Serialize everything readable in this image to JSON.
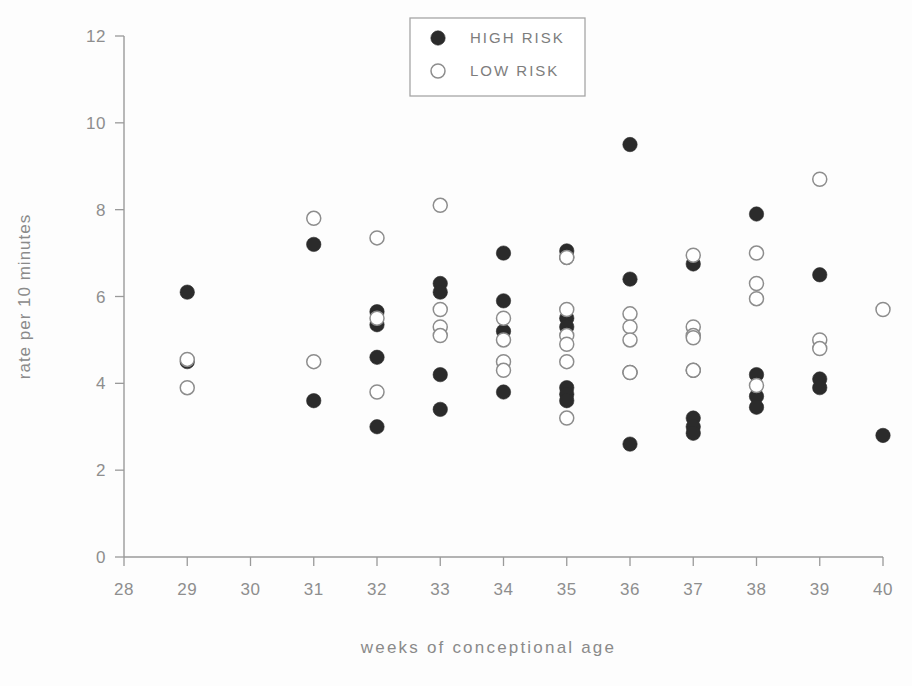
{
  "chart_data": {
    "type": "scatter",
    "title": "",
    "xlabel": "weeks of conceptional age",
    "ylabel": "rate per 10 minutes",
    "xlim": [
      28,
      40
    ],
    "ylim": [
      0,
      12
    ],
    "grid": false,
    "x_ticks": [
      28,
      29,
      30,
      31,
      32,
      33,
      34,
      35,
      36,
      37,
      38,
      39,
      40
    ],
    "x_tick_labels": [
      "28",
      "29",
      "30",
      "31",
      "32",
      "33",
      "34",
      "35",
      "36",
      "37",
      "38",
      "39",
      "40"
    ],
    "y_ticks": [
      0,
      2,
      4,
      6,
      8,
      10,
      12
    ],
    "y_tick_labels": [
      "0",
      "2",
      "4",
      "6",
      "8",
      "10",
      "12"
    ],
    "legend_position": "top-center",
    "series": [
      {
        "name": "HIGH RISK",
        "marker": "filled-circle",
        "color": "#2b2b2b",
        "points": [
          [
            29,
            6.1
          ],
          [
            29,
            4.5
          ],
          [
            31,
            7.2
          ],
          [
            31,
            3.6
          ],
          [
            32,
            5.65
          ],
          [
            32,
            5.35
          ],
          [
            32,
            4.6
          ],
          [
            32,
            3.0
          ],
          [
            33,
            6.3
          ],
          [
            33,
            6.1
          ],
          [
            33,
            4.2
          ],
          [
            33,
            3.4
          ],
          [
            34,
            7.0
          ],
          [
            34,
            5.9
          ],
          [
            34,
            5.2
          ],
          [
            34,
            3.8
          ],
          [
            35,
            7.05
          ],
          [
            35,
            6.9
          ],
          [
            35,
            5.5
          ],
          [
            35,
            5.3
          ],
          [
            35,
            3.9
          ],
          [
            35,
            3.75
          ],
          [
            35,
            3.6
          ],
          [
            36,
            9.5
          ],
          [
            36,
            6.4
          ],
          [
            36,
            4.25
          ],
          [
            36,
            2.6
          ],
          [
            37,
            6.75
          ],
          [
            37,
            4.3
          ],
          [
            37,
            3.2
          ],
          [
            37,
            3.0
          ],
          [
            37,
            2.85
          ],
          [
            38,
            7.9
          ],
          [
            38,
            4.2
          ],
          [
            38,
            3.7
          ],
          [
            38,
            3.45
          ],
          [
            39,
            6.5
          ],
          [
            39,
            4.1
          ],
          [
            39,
            3.9
          ],
          [
            40,
            2.8
          ]
        ]
      },
      {
        "name": "LOW RISK",
        "marker": "open-circle",
        "color": "#8d8d8d",
        "points": [
          [
            29,
            4.55
          ],
          [
            29,
            3.9
          ],
          [
            31,
            7.8
          ],
          [
            31,
            4.5
          ],
          [
            32,
            7.35
          ],
          [
            32,
            5.5
          ],
          [
            32,
            3.8
          ],
          [
            33,
            8.1
          ],
          [
            33,
            5.7
          ],
          [
            33,
            5.3
          ],
          [
            33,
            5.1
          ],
          [
            34,
            5.5
          ],
          [
            34,
            5.0
          ],
          [
            34,
            4.5
          ],
          [
            34,
            4.3
          ],
          [
            35,
            6.9
          ],
          [
            35,
            5.7
          ],
          [
            35,
            5.1
          ],
          [
            35,
            4.9
          ],
          [
            35,
            4.5
          ],
          [
            35,
            3.2
          ],
          [
            36,
            5.6
          ],
          [
            36,
            5.3
          ],
          [
            36,
            5.0
          ],
          [
            36,
            4.25
          ],
          [
            37,
            6.95
          ],
          [
            37,
            5.3
          ],
          [
            37,
            5.1
          ],
          [
            37,
            5.05
          ],
          [
            37,
            4.3
          ],
          [
            38,
            7.0
          ],
          [
            38,
            6.3
          ],
          [
            38,
            5.95
          ],
          [
            38,
            3.95
          ],
          [
            39,
            8.7
          ],
          [
            39,
            5.0
          ],
          [
            39,
            4.8
          ],
          [
            40,
            5.7
          ]
        ]
      }
    ]
  },
  "legend": {
    "entries": [
      {
        "label": "HIGH RISK",
        "marker": "filled-circle"
      },
      {
        "label": "LOW RISK",
        "marker": "open-circle"
      }
    ]
  }
}
